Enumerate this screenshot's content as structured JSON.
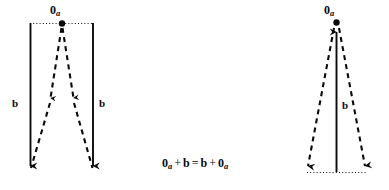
{
  "figure": {
    "background_color": "#ffffff",
    "ink_color": "#0a0a0a",
    "width": 389,
    "height": 190,
    "left_diagram": {
      "name": "zero-plus-b",
      "origin_label": "0",
      "origin_subscript": "a",
      "vector_label_left": "b",
      "vector_label_right": "b",
      "solid_vectors": 2,
      "dashed_vectors": 2,
      "guide_line_style": "dotted",
      "guide_line_position": "top"
    },
    "right_diagram": {
      "name": "b-plus-zero",
      "origin_label": "0",
      "origin_subscript": "a",
      "vector_label": "b",
      "solid_vectors": 1,
      "dashed_vectors": 2,
      "guide_line_style": "dotted",
      "guide_line_position": "bottom"
    },
    "equation": {
      "lhs_zero": "0",
      "lhs_zero_sub": "a",
      "plus": "+",
      "lhs_b": "b",
      "equals": "=",
      "rhs_b": "b",
      "plus2": "+",
      "rhs_zero": "0",
      "rhs_zero_sub": "a",
      "plain_text": "0a + b = b + 0a"
    }
  }
}
